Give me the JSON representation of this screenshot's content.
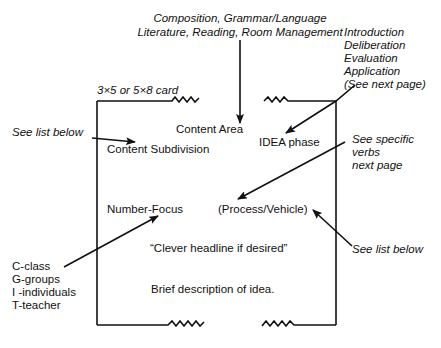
{
  "top_label": {
    "line1": "Composition, Grammar/Language",
    "line2": "Literature, Reading, Room Management"
  },
  "card_size_label": "3×5 or 5×8 card",
  "idea_phases": {
    "items": [
      "Introduction",
      "Deliberation",
      "Evaluation",
      "Application",
      "(See next page)"
    ]
  },
  "card": {
    "content_area": "Content Area",
    "content_subdivision": "Content Subdivision",
    "idea_phase": "IDEA phase",
    "number_focus": "Number-Focus",
    "process_vehicle": "(Process/Vehicle)",
    "headline": "“Clever headline if desired”",
    "description": "Brief description of idea."
  },
  "annotations": {
    "see_list_below_left": "See list below",
    "see_specific_verbs": [
      "See specific",
      "verbs",
      "next page"
    ],
    "see_list_below_right": "See list below"
  },
  "number_focus_key": {
    "items": [
      "C-class",
      "G-groups",
      "I -individuals",
      "T-teacher"
    ]
  },
  "colors": {
    "ink": "#111111",
    "background": "#ffffff"
  }
}
